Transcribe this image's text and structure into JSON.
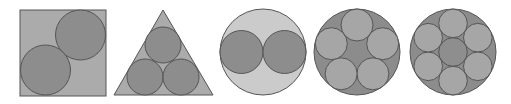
{
  "diagram": {
    "colors": {
      "background": "#ffffff",
      "stroke": "#555555",
      "container_light": "#c8c8c8",
      "container_mid": "#a8a8a8",
      "container_dark": "#8c8c8c",
      "circle_dark": "#8a8a8a",
      "circle_light": "#a6a6a6",
      "center_circle": "#8e8e8e"
    },
    "shapes": [
      {
        "name": "square-with-2-circles",
        "container": "square",
        "circle_count": 2
      },
      {
        "name": "triangle-with-3-circles",
        "container": "triangle",
        "circle_count": 3
      },
      {
        "name": "circle-with-2-circles",
        "container": "circle",
        "circle_count": 2
      },
      {
        "name": "circle-with-5-circles",
        "container": "circle",
        "circle_count": 5
      },
      {
        "name": "circle-with-7-circles",
        "container": "circle",
        "circle_count": 7
      }
    ]
  }
}
